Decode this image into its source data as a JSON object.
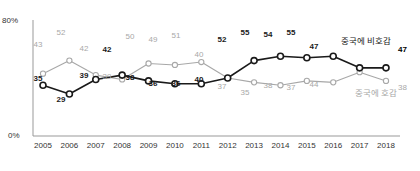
{
  "chart_data": {
    "type": "line",
    "title": "",
    "xlabel": "",
    "ylabel": "",
    "ylim": [
      0,
      80
    ],
    "grid": false,
    "legend_position": "right-inline",
    "categories": [
      "2005",
      "2006",
      "2007",
      "2008",
      "2009",
      "2010",
      "2011",
      "2012",
      "2013",
      "2014",
      "2015",
      "2016",
      "2017",
      "2018"
    ],
    "ytick_labels": [
      "80%",
      "0%"
    ],
    "ytick_values": [
      80,
      0
    ],
    "series": [
      {
        "name": "중국에 비호감",
        "color": "#1a1a1a",
        "values": [
          35,
          29,
          39,
          42,
          38,
          36,
          36,
          40,
          52,
          55,
          54,
          55,
          47,
          47
        ],
        "end_value_label": "47"
      },
      {
        "name": "중국에 호감",
        "color": "#a8a8a8",
        "values": [
          43,
          52,
          42,
          39,
          50,
          49,
          51,
          40,
          37,
          35,
          38,
          37,
          44,
          38
        ],
        "end_value_label": "38"
      }
    ]
  },
  "axis": {
    "y_top_label": "80%",
    "y_bottom_label": "0%"
  },
  "labels": {
    "dark": [
      {
        "text": "35",
        "x": 38,
        "y": 74
      },
      {
        "text": "29",
        "x": 61,
        "y": 95
      },
      {
        "text": "39",
        "x": 84,
        "y": 71
      },
      {
        "text": "42",
        "x": 107,
        "y": 45
      },
      {
        "text": "38",
        "x": 130,
        "y": 73
      },
      {
        "text": "36",
        "x": 153,
        "y": 79
      },
      {
        "text": "36",
        "x": 176,
        "y": 79
      },
      {
        "text": "40",
        "x": 199,
        "y": 75
      },
      {
        "text": "52",
        "x": 222,
        "y": 35
      },
      {
        "text": "55",
        "x": 245,
        "y": 28
      },
      {
        "text": "54",
        "x": 268,
        "y": 30
      },
      {
        "text": "55",
        "x": 291,
        "y": 28
      },
      {
        "text": "47",
        "x": 314,
        "y": 42
      }
    ],
    "light": [
      {
        "text": "43",
        "x": 38,
        "y": 40
      },
      {
        "text": "52",
        "x": 61,
        "y": 28
      },
      {
        "text": "42",
        "x": 84,
        "y": 44
      },
      {
        "text": "39",
        "x": 107,
        "y": 72
      },
      {
        "text": "50",
        "x": 130,
        "y": 32
      },
      {
        "text": "49",
        "x": 153,
        "y": 35
      },
      {
        "text": "51",
        "x": 176,
        "y": 31
      },
      {
        "text": "40",
        "x": 199,
        "y": 50
      },
      {
        "text": "37",
        "x": 222,
        "y": 82
      },
      {
        "text": "35",
        "x": 245,
        "y": 88
      },
      {
        "text": "38",
        "x": 268,
        "y": 81
      },
      {
        "text": "37",
        "x": 291,
        "y": 83
      },
      {
        "text": "44",
        "x": 314,
        "y": 80
      }
    ]
  }
}
